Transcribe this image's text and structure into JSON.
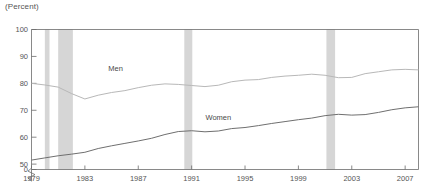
{
  "chart_data": {
    "type": "line",
    "title": "",
    "ylabel": "(Percent)",
    "xlabel": "",
    "ylim": [
      48,
      100
    ],
    "xlim": [
      1979,
      2008
    ],
    "grid": false,
    "legend_position": "inline-annotations",
    "y_ticks": [
      "100",
      "90",
      "80",
      "70",
      "60",
      "50",
      "0"
    ],
    "y_tick_values": [
      100,
      90,
      80,
      70,
      60,
      50,
      0
    ],
    "axis_break": true,
    "axis_break_note": "y-axis broken between 0 and 50",
    "x_ticks": [
      "1979",
      "1983",
      "1987",
      "1991",
      "1995",
      "1999",
      "2003",
      "2007"
    ],
    "x_tick_values": [
      1979,
      1983,
      1987,
      1991,
      1995,
      1999,
      2003,
      2007
    ],
    "x": [
      1979,
      1980,
      1981,
      1982,
      1983,
      1984,
      1985,
      1986,
      1987,
      1988,
      1989,
      1990,
      1991,
      1992,
      1993,
      1994,
      1995,
      1996,
      1997,
      1998,
      1999,
      2000,
      2001,
      2002,
      2003,
      2004,
      2005,
      2006,
      2007,
      2008
    ],
    "series": [
      {
        "name": "Men",
        "label": "Men",
        "color": "#b8b8b8",
        "label_x": 1985.3,
        "label_y": 84.5,
        "values": [
          80.0,
          79.4,
          78.6,
          76.2,
          74.2,
          75.6,
          76.6,
          77.3,
          78.4,
          79.3,
          79.8,
          79.6,
          79.2,
          78.8,
          79.3,
          80.6,
          81.2,
          81.4,
          82.2,
          82.7,
          83.0,
          83.4,
          83.0,
          82.1,
          82.2,
          83.6,
          84.3,
          85.0,
          85.2,
          85.0
        ]
      },
      {
        "name": "Women",
        "label": "Women",
        "color": "#6f6f6f",
        "label_x": 1993.0,
        "label_y": 66.5,
        "values": [
          51.5,
          52.3,
          53.1,
          53.7,
          54.4,
          55.8,
          56.8,
          57.7,
          58.6,
          59.6,
          61.0,
          62.1,
          62.4,
          62.0,
          62.3,
          63.2,
          63.6,
          64.3,
          65.1,
          65.8,
          66.5,
          67.1,
          68.0,
          68.5,
          68.2,
          68.4,
          69.2,
          70.2,
          70.9,
          71.3
        ]
      }
    ],
    "shaded_bands": [
      {
        "name": "recession-1980",
        "start": 1980.0,
        "end": 1980.35
      },
      {
        "name": "recession-1981-1982",
        "start": 1981.0,
        "end": 1982.1
      },
      {
        "name": "recession-1990-1991",
        "start": 1990.45,
        "end": 1991.05
      },
      {
        "name": "recession-2001",
        "start": 2001.1,
        "end": 2001.75
      }
    ],
    "band_color": "#d6d6d6"
  }
}
